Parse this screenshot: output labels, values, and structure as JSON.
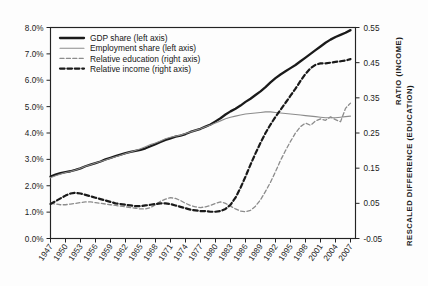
{
  "chart_data": {
    "type": "line",
    "title": "",
    "xlabel": "",
    "ylabel_left": "",
    "ylabel_right_line1": "RATIO (INCOME)",
    "ylabel_right_line2": "RESCALED DIFFERENCE (EDUCATION)",
    "grid": false,
    "legend_position": "top-left-inside",
    "xlim": [
      1947,
      2008
    ],
    "ylim_left": [
      0.0,
      8.0
    ],
    "ylim_right": [
      -0.05,
      0.55
    ],
    "left_tick_labels": [
      "0.0%",
      "1.0%",
      "2.0%",
      "3.0%",
      "4.0%",
      "5.0%",
      "6.0%",
      "7.0%",
      "8.0%"
    ],
    "left_tick_values": [
      0.0,
      1.0,
      2.0,
      3.0,
      4.0,
      5.0,
      6.0,
      7.0,
      8.0
    ],
    "right_tick_labels": [
      "-0.05",
      "0.05",
      "0.15",
      "0.25",
      "0.35",
      "0.45",
      "0.55"
    ],
    "right_tick_values": [
      -0.05,
      0.05,
      0.15,
      0.25,
      0.35,
      0.45,
      0.55
    ],
    "xtick_labels": [
      "1947",
      "1950",
      "1953",
      "1956",
      "1959",
      "1962",
      "1965",
      "1968",
      "1971",
      "1974",
      "1977",
      "1980",
      "1983",
      "1986",
      "1989",
      "1992",
      "1995",
      "1998",
      "2001",
      "2004",
      "2007"
    ],
    "xtick_values": [
      1947,
      1950,
      1953,
      1956,
      1959,
      1962,
      1965,
      1968,
      1971,
      1974,
      1977,
      1980,
      1983,
      1986,
      1989,
      1992,
      1995,
      1998,
      2001,
      2004,
      2007
    ],
    "x": [
      1947,
      1948,
      1949,
      1950,
      1951,
      1952,
      1953,
      1954,
      1955,
      1956,
      1957,
      1958,
      1959,
      1960,
      1961,
      1962,
      1963,
      1964,
      1965,
      1966,
      1967,
      1968,
      1969,
      1970,
      1971,
      1972,
      1973,
      1974,
      1975,
      1976,
      1977,
      1978,
      1979,
      1980,
      1981,
      1982,
      1983,
      1984,
      1985,
      1986,
      1987,
      1988,
      1989,
      1990,
      1991,
      1992,
      1993,
      1994,
      1995,
      1996,
      1997,
      1998,
      1999,
      2000,
      2001,
      2002,
      2003,
      2004,
      2005,
      2006,
      2007
    ],
    "series": [
      {
        "name": "GDP share (left axis)",
        "axis": "left",
        "style": "solid-thick",
        "color": "#1a1a1a",
        "values": [
          2.35,
          2.42,
          2.48,
          2.52,
          2.55,
          2.6,
          2.66,
          2.74,
          2.8,
          2.86,
          2.92,
          3.0,
          3.06,
          3.12,
          3.18,
          3.24,
          3.28,
          3.32,
          3.36,
          3.42,
          3.5,
          3.58,
          3.66,
          3.74,
          3.8,
          3.86,
          3.9,
          3.96,
          4.04,
          4.1,
          4.16,
          4.24,
          4.32,
          4.44,
          4.56,
          4.7,
          4.82,
          4.92,
          5.04,
          5.18,
          5.3,
          5.44,
          5.58,
          5.74,
          5.92,
          6.08,
          6.22,
          6.34,
          6.46,
          6.58,
          6.72,
          6.86,
          7.0,
          7.14,
          7.28,
          7.42,
          7.54,
          7.64,
          7.72,
          7.8,
          7.9
        ]
      },
      {
        "name": "Employment share (left axis)",
        "axis": "left",
        "style": "solid-thin",
        "color": "#8c8c8c",
        "values": [
          2.3,
          2.38,
          2.44,
          2.5,
          2.54,
          2.6,
          2.66,
          2.74,
          2.8,
          2.86,
          2.92,
          2.98,
          3.04,
          3.1,
          3.16,
          3.22,
          3.28,
          3.34,
          3.4,
          3.48,
          3.56,
          3.62,
          3.7,
          3.78,
          3.84,
          3.88,
          3.92,
          3.98,
          4.04,
          4.1,
          4.16,
          4.24,
          4.3,
          4.38,
          4.46,
          4.54,
          4.6,
          4.64,
          4.68,
          4.72,
          4.74,
          4.76,
          4.78,
          4.8,
          4.8,
          4.78,
          4.76,
          4.74,
          4.72,
          4.7,
          4.68,
          4.66,
          4.64,
          4.62,
          4.6,
          4.58,
          4.58,
          4.58,
          4.6,
          4.62,
          4.64
        ]
      },
      {
        "name": "Relative education (right axis)",
        "axis": "right",
        "style": "dashed-thin",
        "color": "#8c8c8c",
        "values": [
          0.05,
          0.048,
          0.046,
          0.046,
          0.048,
          0.05,
          0.052,
          0.054,
          0.054,
          0.052,
          0.05,
          0.048,
          0.046,
          0.044,
          0.042,
          0.04,
          0.038,
          0.036,
          0.034,
          0.034,
          0.038,
          0.046,
          0.056,
          0.062,
          0.066,
          0.064,
          0.058,
          0.05,
          0.044,
          0.04,
          0.038,
          0.04,
          0.044,
          0.05,
          0.054,
          0.05,
          0.042,
          0.034,
          0.028,
          0.026,
          0.03,
          0.042,
          0.06,
          0.084,
          0.11,
          0.14,
          0.172,
          0.2,
          0.226,
          0.25,
          0.268,
          0.278,
          0.272,
          0.284,
          0.29,
          0.286,
          0.296,
          0.288,
          0.282,
          0.32,
          0.335
        ]
      },
      {
        "name": "Relative income (right axis)",
        "axis": "right",
        "style": "dashed-thick",
        "color": "#1a1a1a",
        "values": [
          0.048,
          0.056,
          0.064,
          0.072,
          0.078,
          0.08,
          0.078,
          0.074,
          0.07,
          0.066,
          0.062,
          0.058,
          0.054,
          0.05,
          0.048,
          0.046,
          0.044,
          0.042,
          0.042,
          0.044,
          0.046,
          0.048,
          0.05,
          0.05,
          0.048,
          0.044,
          0.04,
          0.036,
          0.032,
          0.03,
          0.028,
          0.028,
          0.026,
          0.026,
          0.028,
          0.034,
          0.046,
          0.066,
          0.094,
          0.126,
          0.16,
          0.192,
          0.222,
          0.25,
          0.274,
          0.296,
          0.316,
          0.336,
          0.356,
          0.376,
          0.398,
          0.418,
          0.434,
          0.444,
          0.448,
          0.448,
          0.45,
          0.452,
          0.454,
          0.456,
          0.46
        ]
      }
    ],
    "legend": [
      {
        "label": "GDP share (left axis)",
        "style": "solid-thick",
        "color": "#1a1a1a"
      },
      {
        "label": "Employment share (left axis)",
        "style": "solid-thin",
        "color": "#8c8c8c"
      },
      {
        "label": "Relative education (right axis)",
        "style": "dashed-thin",
        "color": "#8c8c8c"
      },
      {
        "label": "Relative income (right axis)",
        "style": "dashed-thick",
        "color": "#1a1a1a"
      }
    ]
  }
}
